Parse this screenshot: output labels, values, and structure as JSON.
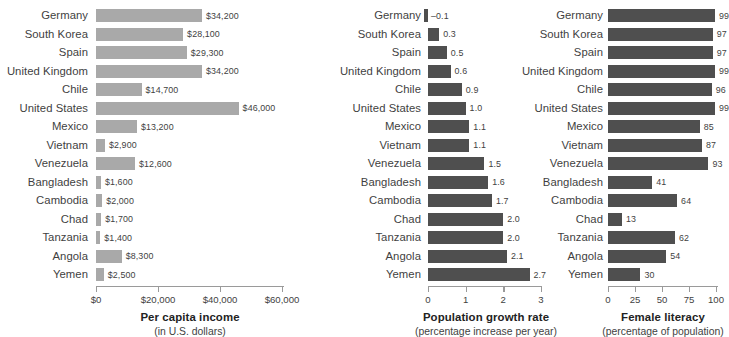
{
  "chart_data": [
    {
      "type": "bar",
      "orientation": "horizontal",
      "title": "Per capita income",
      "subtitle": "(in U.S. dollars)",
      "xlabel": "",
      "ylabel": "",
      "grid": false,
      "legend": "none",
      "xlim": [
        0,
        60000
      ],
      "ticks": [
        "$0",
        "$20,000",
        "$40,000",
        "$60,000"
      ],
      "tick_values": [
        0,
        20000,
        40000,
        60000
      ],
      "categories": [
        "Germany",
        "South Korea",
        "Spain",
        "United Kingdom",
        "Chile",
        "United States",
        "Mexico",
        "Vietnam",
        "Venezuela",
        "Bangladesh",
        "Cambodia",
        "Chad",
        "Tanzania",
        "Angola",
        "Yemen"
      ],
      "values": [
        34200,
        28100,
        29300,
        34200,
        14700,
        46000,
        13200,
        2900,
        12600,
        1600,
        2000,
        1700,
        1400,
        8300,
        2500
      ],
      "labels": [
        "$34,200",
        "$28,100",
        "$29,300",
        "$34,200",
        "$14,700",
        "$46,000",
        "$13,200",
        "$2,900",
        "$12,600",
        "$1,600",
        "$2,000",
        "$1,700",
        "$1,400",
        "$8,300",
        "$2,500"
      ],
      "bar_color": "#a9a9a9"
    },
    {
      "type": "bar",
      "orientation": "horizontal",
      "title": "Population growth rate",
      "subtitle": "(percentage increase per year)",
      "xlabel": "",
      "ylabel": "",
      "grid": false,
      "legend": "none",
      "xlim": [
        -0.3,
        3
      ],
      "ticks": [
        "0",
        "1",
        "2",
        "3"
      ],
      "tick_values": [
        0,
        1,
        2,
        3
      ],
      "categories": [
        "Germany",
        "South Korea",
        "Spain",
        "United Kingdom",
        "Chile",
        "United States",
        "Mexico",
        "Vietnam",
        "Venezuela",
        "Bangladesh",
        "Cambodia",
        "Chad",
        "Tanzania",
        "Angola",
        "Yemen"
      ],
      "values": [
        -0.1,
        0.3,
        0.5,
        0.6,
        0.9,
        1.0,
        1.1,
        1.1,
        1.5,
        1.6,
        1.7,
        2.0,
        2.0,
        2.1,
        2.7
      ],
      "labels": [
        "–0.1",
        "0.3",
        "0.5",
        "0.6",
        "0.9",
        "1.0",
        "1.1",
        "1.1",
        "1.5",
        "1.6",
        "1.7",
        "2.0",
        "2.0",
        "2.1",
        "2.7"
      ],
      "bar_color": "#4f4f4f"
    },
    {
      "type": "bar",
      "orientation": "horizontal",
      "title": "Female literacy",
      "subtitle": "(percentage of population)",
      "xlabel": "",
      "ylabel": "",
      "grid": false,
      "legend": "none",
      "xlim": [
        0,
        100
      ],
      "ticks": [
        "0",
        "25",
        "50",
        "75",
        "100"
      ],
      "tick_values": [
        0,
        25,
        50,
        75,
        100
      ],
      "categories": [
        "Germany",
        "South Korea",
        "Spain",
        "United Kingdom",
        "Chile",
        "United States",
        "Mexico",
        "Vietnam",
        "Venezuela",
        "Bangladesh",
        "Cambodia",
        "Chad",
        "Tanzania",
        "Angola",
        "Yemen"
      ],
      "values": [
        99,
        97,
        97,
        99,
        96,
        99,
        85,
        87,
        93,
        41,
        64,
        13,
        62,
        54,
        30
      ],
      "labels": [
        "99",
        "97",
        "97",
        "99",
        "96",
        "99",
        "85",
        "87",
        "93",
        "41",
        "64",
        "13",
        "62",
        "54",
        "30"
      ],
      "bar_color": "#4f4f4f"
    }
  ]
}
